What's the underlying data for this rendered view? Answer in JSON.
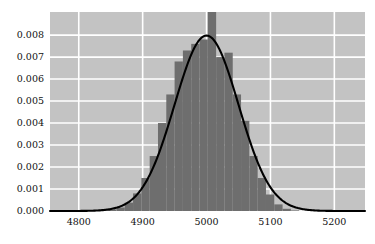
{
  "chart_data": {
    "type": "bar",
    "title": "",
    "subtitle": "",
    "xlabel": "",
    "ylabel": "",
    "xlim": [
      4755,
      4,
      0
    ],
    "x_range": [
      4755,
      5248
    ],
    "ylim": [
      0.0,
      0.00905
    ],
    "grid": true,
    "legend": null,
    "annotations": [],
    "xticks": [
      4800,
      4900,
      5000,
      5100,
      5200
    ],
    "xtick_labels": [
      "4800",
      "4900",
      "5000",
      "5100",
      "5200"
    ],
    "yticks": [
      0.0,
      0.001,
      0.002,
      0.003,
      0.004,
      0.005,
      0.006,
      0.007,
      0.008
    ],
    "ytick_labels": [
      "0.000",
      "0.001",
      "0.002",
      "0.003",
      "0.004",
      "0.005",
      "0.006",
      "0.007",
      "0.008"
    ],
    "colors": {
      "plot_background": "#c3c3c3",
      "figure_background": "#ffffff",
      "bar_fill": "#6e6e6e",
      "gridline": "#ffffff",
      "curve": "#000000",
      "tick_text": "#111111"
    },
    "series": [
      {
        "name": "histogram",
        "type": "bar",
        "bin_width": 13,
        "bin_centers": [
          4800.5,
          4813.5,
          4826.5,
          4839.5,
          4852.5,
          4865.5,
          4878.5,
          4891.5,
          4904.5,
          4917.5,
          4930.5,
          4943.5,
          4956.5,
          4969.5,
          4982.5,
          4995.5,
          5008.5,
          5021.5,
          5034.5,
          5047.5,
          5060.5,
          5073.5,
          5086.5,
          5099.5,
          5112.5,
          5125.5,
          5138.5,
          5151.5
        ],
        "values": [
          0.0,
          0.0,
          0.0,
          2e-05,
          6e-05,
          0.00016,
          0.00038,
          0.0008,
          0.0015,
          0.0025,
          0.004,
          0.0053,
          0.0068,
          0.0073,
          0.0076,
          0.0078,
          0.00905,
          0.007,
          0.0072,
          0.0053,
          0.0041,
          0.0025,
          0.0015,
          0.00075,
          0.0003,
          0.0001,
          3e-05,
          0.0
        ]
      },
      {
        "name": "normal-density-curve",
        "type": "line",
        "distribution": "normal",
        "mean": 5000,
        "sigma": 50,
        "peak_value": 0.00798
      }
    ]
  }
}
